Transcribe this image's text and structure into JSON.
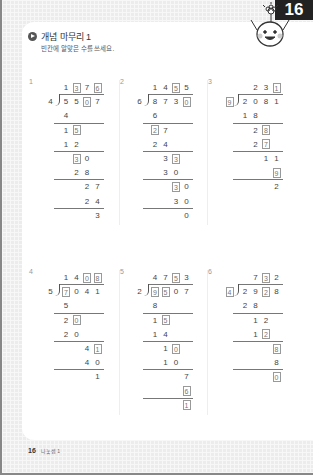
{
  "page_number": "16",
  "header": {
    "title": "개념 마무리 1",
    "instruction": "빈칸에 알맞은 수를 쓰세요."
  },
  "footer": {
    "page_number": "16",
    "label": "나눗셈 1"
  },
  "problems": [
    {
      "number": "1",
      "divisor": "4",
      "divisor_boxed": false,
      "quotient": [
        {
          "d": "1",
          "box": false
        },
        {
          "d": "3",
          "box": true
        },
        {
          "d": "7",
          "box": false
        },
        {
          "d": "6",
          "box": true
        }
      ],
      "dividend": [
        {
          "d": "5",
          "box": false
        },
        {
          "d": "5",
          "box": false
        },
        {
          "d": "0",
          "box": true
        },
        {
          "d": "7",
          "box": false
        }
      ],
      "steps": [
        {
          "start": 0,
          "digits": [
            {
              "d": "4",
              "box": false
            }
          ],
          "line_after": true
        },
        {
          "start": 0,
          "digits": [
            {
              "d": "1",
              "box": false
            },
            {
              "d": "5",
              "box": true
            }
          ],
          "line_after": false
        },
        {
          "start": 0,
          "digits": [
            {
              "d": "1",
              "box": false
            },
            {
              "d": "2",
              "box": false
            }
          ],
          "line_after": true
        },
        {
          "start": 1,
          "digits": [
            {
              "d": "3",
              "box": true
            },
            {
              "d": "0",
              "box": false
            }
          ],
          "line_after": false
        },
        {
          "start": 1,
          "digits": [
            {
              "d": "2",
              "box": false
            },
            {
              "d": "8",
              "box": false
            }
          ],
          "line_after": true
        },
        {
          "start": 2,
          "digits": [
            {
              "d": "2",
              "box": false
            },
            {
              "d": "7",
              "box": false
            }
          ],
          "line_after": false
        },
        {
          "start": 2,
          "digits": [
            {
              "d": "2",
              "box": false
            },
            {
              "d": "4",
              "box": false
            }
          ],
          "line_after": true
        },
        {
          "start": 3,
          "digits": [
            {
              "d": "3",
              "box": false
            }
          ],
          "line_after": false
        }
      ]
    },
    {
      "number": "2",
      "divisor": "6",
      "divisor_boxed": false,
      "quotient": [
        {
          "d": "1",
          "box": false
        },
        {
          "d": "4",
          "box": false
        },
        {
          "d": "5",
          "box": true
        },
        {
          "d": "5",
          "box": false
        }
      ],
      "dividend": [
        {
          "d": "8",
          "box": false
        },
        {
          "d": "7",
          "box": false
        },
        {
          "d": "3",
          "box": false
        },
        {
          "d": "0",
          "box": true
        }
      ],
      "steps": [
        {
          "start": 0,
          "digits": [
            {
              "d": "6",
              "box": false
            }
          ],
          "line_after": true
        },
        {
          "start": 0,
          "digits": [
            {
              "d": "2",
              "box": true
            },
            {
              "d": "7",
              "box": false
            }
          ],
          "line_after": false
        },
        {
          "start": 0,
          "digits": [
            {
              "d": "2",
              "box": false
            },
            {
              "d": "4",
              "box": false
            }
          ],
          "line_after": true
        },
        {
          "start": 1,
          "digits": [
            {
              "d": "3",
              "box": false
            },
            {
              "d": "3",
              "box": true
            }
          ],
          "line_after": false
        },
        {
          "start": 1,
          "digits": [
            {
              "d": "3",
              "box": false
            },
            {
              "d": "0",
              "box": false
            }
          ],
          "line_after": true
        },
        {
          "start": 2,
          "digits": [
            {
              "d": "3",
              "box": true
            },
            {
              "d": "0",
              "box": false
            }
          ],
          "line_after": false
        },
        {
          "start": 2,
          "digits": [
            {
              "d": "3",
              "box": false
            },
            {
              "d": "0",
              "box": false
            }
          ],
          "line_after": true
        },
        {
          "start": 3,
          "digits": [
            {
              "d": "0",
              "box": false
            }
          ],
          "line_after": false
        }
      ]
    },
    {
      "number": "3",
      "divisor": "9",
      "divisor_boxed": true,
      "quotient": [
        {
          "d": "",
          "box": false
        },
        {
          "d": "2",
          "box": false
        },
        {
          "d": "3",
          "box": false
        },
        {
          "d": "1",
          "box": true
        }
      ],
      "dividend": [
        {
          "d": "2",
          "box": false
        },
        {
          "d": "0",
          "box": false
        },
        {
          "d": "8",
          "box": false
        },
        {
          "d": "1",
          "box": false
        }
      ],
      "steps": [
        {
          "start": 0,
          "digits": [
            {
              "d": "1",
              "box": false
            },
            {
              "d": "8",
              "box": false
            }
          ],
          "line_after": true
        },
        {
          "start": 1,
          "digits": [
            {
              "d": "2",
              "box": false
            },
            {
              "d": "8",
              "box": true
            }
          ],
          "line_after": false
        },
        {
          "start": 1,
          "digits": [
            {
              "d": "2",
              "box": false
            },
            {
              "d": "7",
              "box": true
            }
          ],
          "line_after": true
        },
        {
          "start": 2,
          "digits": [
            {
              "d": "1",
              "box": false
            },
            {
              "d": "1",
              "box": false
            }
          ],
          "line_after": false
        },
        {
          "start": 3,
          "digits": [
            {
              "d": "9",
              "box": true
            }
          ],
          "line_after": true
        },
        {
          "start": 3,
          "digits": [
            {
              "d": "2",
              "box": false
            }
          ],
          "line_after": false
        }
      ]
    },
    {
      "number": "4",
      "divisor": "5",
      "divisor_boxed": false,
      "quotient": [
        {
          "d": "1",
          "box": false
        },
        {
          "d": "4",
          "box": false
        },
        {
          "d": "0",
          "box": true
        },
        {
          "d": "8",
          "box": true
        }
      ],
      "dividend": [
        {
          "d": "7",
          "box": true
        },
        {
          "d": "0",
          "box": false
        },
        {
          "d": "4",
          "box": false
        },
        {
          "d": "1",
          "box": false
        }
      ],
      "steps": [
        {
          "start": 0,
          "digits": [
            {
              "d": "5",
              "box": false
            }
          ],
          "line_after": true
        },
        {
          "start": 0,
          "digits": [
            {
              "d": "2",
              "box": false
            },
            {
              "d": "0",
              "box": true
            }
          ],
          "line_after": false
        },
        {
          "start": 0,
          "digits": [
            {
              "d": "2",
              "box": false
            },
            {
              "d": "0",
              "box": false
            }
          ],
          "line_after": true
        },
        {
          "start": 2,
          "digits": [
            {
              "d": "4",
              "box": false
            },
            {
              "d": "1",
              "box": true
            }
          ],
          "line_after": false
        },
        {
          "start": 2,
          "digits": [
            {
              "d": "4",
              "box": false
            },
            {
              "d": "0",
              "box": false
            }
          ],
          "line_after": true
        },
        {
          "start": 3,
          "digits": [
            {
              "d": "1",
              "box": false
            }
          ],
          "line_after": false
        }
      ]
    },
    {
      "number": "5",
      "divisor": "2",
      "divisor_boxed": false,
      "quotient": [
        {
          "d": "4",
          "box": false
        },
        {
          "d": "7",
          "box": false
        },
        {
          "d": "5",
          "box": true
        },
        {
          "d": "3",
          "box": false
        }
      ],
      "dividend": [
        {
          "d": "9",
          "box": true
        },
        {
          "d": "5",
          "box": true
        },
        {
          "d": "0",
          "box": false
        },
        {
          "d": "7",
          "box": false
        }
      ],
      "steps": [
        {
          "start": 0,
          "digits": [
            {
              "d": "8",
              "box": false
            }
          ],
          "line_after": true
        },
        {
          "start": 0,
          "digits": [
            {
              "d": "1",
              "box": false
            },
            {
              "d": "5",
              "box": true
            }
          ],
          "line_after": false
        },
        {
          "start": 0,
          "digits": [
            {
              "d": "1",
              "box": false
            },
            {
              "d": "4",
              "box": false
            }
          ],
          "line_after": true
        },
        {
          "start": 1,
          "digits": [
            {
              "d": "1",
              "box": false
            },
            {
              "d": "0",
              "box": true
            }
          ],
          "line_after": false
        },
        {
          "start": 1,
          "digits": [
            {
              "d": "1",
              "box": false
            },
            {
              "d": "0",
              "box": false
            }
          ],
          "line_after": true
        },
        {
          "start": 3,
          "digits": [
            {
              "d": "7",
              "box": false
            }
          ],
          "line_after": false
        },
        {
          "start": 3,
          "digits": [
            {
              "d": "6",
              "box": true
            }
          ],
          "line_after": true
        },
        {
          "start": 3,
          "digits": [
            {
              "d": "1",
              "box": true
            }
          ],
          "line_after": false
        }
      ]
    },
    {
      "number": "6",
      "divisor": "4",
      "divisor_boxed": true,
      "quotient": [
        {
          "d": "",
          "box": false
        },
        {
          "d": "7",
          "box": false
        },
        {
          "d": "3",
          "box": true
        },
        {
          "d": "2",
          "box": false
        }
      ],
      "dividend": [
        {
          "d": "2",
          "box": false
        },
        {
          "d": "9",
          "box": false
        },
        {
          "d": "2",
          "box": true
        },
        {
          "d": "8",
          "box": false
        }
      ],
      "steps": [
        {
          "start": 0,
          "digits": [
            {
              "d": "2",
              "box": false
            },
            {
              "d": "8",
              "box": false
            }
          ],
          "line_after": true
        },
        {
          "start": 1,
          "digits": [
            {
              "d": "1",
              "box": false
            },
            {
              "d": "2",
              "box": false
            }
          ],
          "line_after": false
        },
        {
          "start": 1,
          "digits": [
            {
              "d": "1",
              "box": false
            },
            {
              "d": "2",
              "box": true
            }
          ],
          "line_after": true
        },
        {
          "start": 3,
          "digits": [
            {
              "d": "8",
              "box": true
            }
          ],
          "line_after": false
        },
        {
          "start": 3,
          "digits": [
            {
              "d": "8",
              "box": false
            }
          ],
          "line_after": true
        },
        {
          "start": 3,
          "digits": [
            {
              "d": "0",
              "box": true
            }
          ],
          "line_after": false
        }
      ]
    }
  ]
}
